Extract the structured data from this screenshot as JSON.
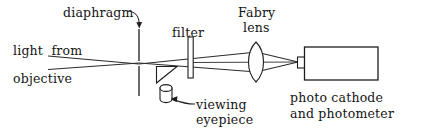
{
  "figure": {
    "kind": "optical-ray-diagram",
    "ink_color": "#141414",
    "background_color": "#ffffff",
    "width": 422,
    "height": 140
  },
  "labels": {
    "diaphragm": "diaphragm",
    "light_from": "light  from",
    "objective": "objective",
    "filter": "filter",
    "fabry": "Fabry",
    "lens": "lens",
    "viewing": "viewing",
    "eyepiece": "eyepiece",
    "photo_cathode": "photo cathode",
    "and_photometer": "and photometer"
  },
  "components": {
    "diaphragm": {
      "name": "diaphragm-aperture",
      "shape": "vertical-line",
      "x": 139,
      "y_top": 30,
      "y_bottom": 96
    },
    "filter": {
      "name": "filter-plate",
      "shape": "narrow-rectangle",
      "x": 188,
      "y": 37,
      "w": 5,
      "h": 41
    },
    "prism": {
      "name": "beam-splitter-prism",
      "shape": "right-triangle",
      "x": 156,
      "y": 66,
      "w": 21,
      "h": 17
    },
    "eyepiece": {
      "name": "viewing-eyepiece",
      "shape": "cylinder",
      "x": 160,
      "y": 85,
      "w": 12,
      "h": 18
    },
    "fabry_lens": {
      "name": "fabry-lens",
      "shape": "biconvex-lens",
      "cx": 256,
      "cy": 62,
      "rx": 10,
      "ry": 20
    },
    "detector": {
      "name": "photo-cathode-photometer-box",
      "shape": "rectangle",
      "x": 304,
      "y": 47,
      "w": 74,
      "h": 33
    },
    "detector_window": {
      "name": "detector-entrance-window",
      "shape": "small-rectangle",
      "x": 298,
      "y": 57,
      "w": 7,
      "h": 11
    }
  },
  "rays": {
    "upper_in": {
      "name": "upper-incoming-ray",
      "x1": 48,
      "y1": 56,
      "x2": 139,
      "y2": 64
    },
    "lower_in": {
      "name": "lower-incoming-ray",
      "x1": 48,
      "y1": 69,
      "x2": 139,
      "y2": 63
    },
    "upper_out": {
      "name": "upper-ray-to-lens",
      "x1": 139,
      "y1": 64,
      "x2": 256,
      "y2": 52
    },
    "lower_out": {
      "name": "lower-ray-to-lens",
      "x1": 139,
      "y1": 63,
      "x2": 256,
      "y2": 72
    },
    "upper_focus": {
      "name": "upper-ray-to-detector",
      "x1": 256,
      "y1": 52,
      "x2": 298,
      "y2": 62
    },
    "lower_focus": {
      "name": "lower-ray-to-detector",
      "x1": 256,
      "y1": 72,
      "x2": 298,
      "y2": 62
    }
  },
  "leader_arrows": {
    "diaphragm_arrow": {
      "name": "diaphragm-leader-arrow",
      "from_x": 128,
      "from_y": 12,
      "to_x": 139,
      "to_y": 29
    },
    "eyepiece_arrow": {
      "name": "eyepiece-leader-arrow",
      "from_x": 196,
      "from_y": 106,
      "to_x": 172,
      "to_y": 99
    }
  }
}
